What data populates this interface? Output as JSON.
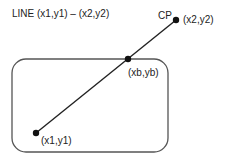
{
  "title": "LINE (x1,y1) – (x2,y2)",
  "labels": {
    "cp": "CP",
    "end_point": "(x2,y2)",
    "boundary_point": "(xb,yb)",
    "start_point": "(x1,y1)"
  },
  "colors": {
    "stroke": "#222222",
    "box_stroke": "#555555",
    "background": "#ffffff"
  }
}
